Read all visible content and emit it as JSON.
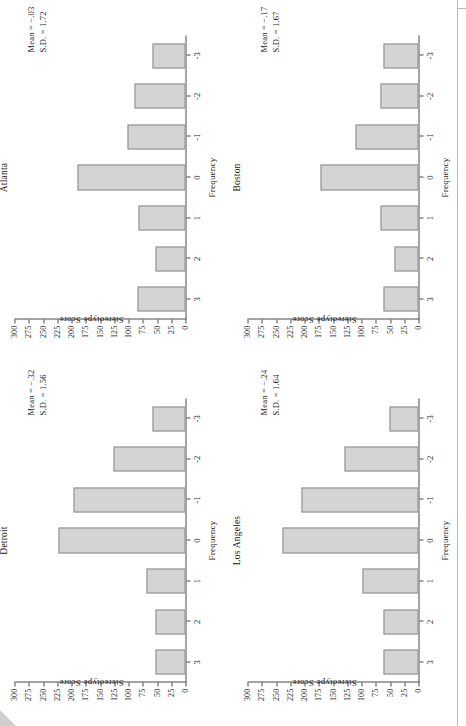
{
  "figure": {
    "orientation": "rotated-90-ccw",
    "panel_count": 4,
    "bar_fill": "#d4d4d4",
    "bar_stroke": "#8a8a8a"
  },
  "labels": {
    "frequency_axis_title": "Frequency",
    "score_axis_title": "Stereotype Score",
    "mean_prefix": "Mean = ",
    "sd_prefix": "S.D. = "
  },
  "chart_data": [
    {
      "type": "bar",
      "title": "Atlanta",
      "xlabel": "Stereotype Score",
      "ylabel": "Frequency",
      "categories": [
        "3",
        "2",
        "1",
        "0",
        "-1",
        "-2",
        "-3"
      ],
      "values": [
        85,
        52,
        82,
        190,
        101,
        90,
        58
      ],
      "ylim": [
        0,
        300
      ],
      "yticks": [
        0,
        25,
        50,
        75,
        100,
        125,
        150,
        175,
        200,
        225,
        250,
        275,
        300
      ],
      "ytick_labels": [
        "0",
        "25",
        "50",
        "75",
        "100",
        "125",
        "150",
        "175",
        "200",
        "225",
        "250",
        "275",
        "300"
      ],
      "grid": false,
      "legend": "none",
      "annotations": {
        "mean": "Mean = −.03",
        "sd": "S.D. = 1.72"
      }
    },
    {
      "type": "bar",
      "title": "Boston",
      "xlabel": "Stereotype Score",
      "ylabel": "Frequency",
      "categories": [
        "3",
        "2",
        "1",
        "0",
        "-1",
        "-2",
        "-3"
      ],
      "values": [
        62,
        42,
        67,
        172,
        110,
        67,
        61
      ],
      "ylim": [
        0,
        300
      ],
      "yticks": [
        0,
        25,
        50,
        75,
        100,
        125,
        150,
        175,
        200,
        225,
        250,
        275,
        300
      ],
      "ytick_labels": [
        "0",
        "25",
        "50",
        "75",
        "100",
        "125",
        "150",
        "175",
        "200",
        "225",
        "250",
        "275",
        "300"
      ],
      "grid": false,
      "legend": "none",
      "annotations": {
        "mean": "Mean = −.17",
        "sd": "S.D. = 1.67"
      }
    },
    {
      "type": "bar",
      "title": "Detroit",
      "xlabel": "Stereotype Score",
      "ylabel": "Frequency",
      "categories": [
        "3",
        "2",
        "1",
        "0",
        "-1",
        "-2",
        "-3"
      ],
      "values": [
        52,
        52,
        68,
        222,
        196,
        126,
        58
      ],
      "ylim": [
        0,
        300
      ],
      "yticks": [
        0,
        25,
        50,
        75,
        100,
        125,
        150,
        175,
        200,
        225,
        250,
        275,
        300
      ],
      "ytick_labels": [
        "0",
        "25",
        "50",
        "75",
        "100",
        "125",
        "150",
        "175",
        "200",
        "225",
        "250",
        "275",
        "300"
      ],
      "grid": false,
      "legend": "none",
      "annotations": {
        "mean": "Mean = −.32",
        "sd": "S.D. = 1.56"
      }
    },
    {
      "type": "bar",
      "title": "Los Angeles",
      "xlabel": "Stereotype Score",
      "ylabel": "Frequency",
      "categories": [
        "3",
        "2",
        "1",
        "0",
        "-1",
        "-2",
        "-3"
      ],
      "values": [
        61,
        61,
        98,
        238,
        205,
        130,
        51
      ],
      "ylim": [
        0,
        300
      ],
      "yticks": [
        0,
        25,
        50,
        75,
        100,
        125,
        150,
        175,
        200,
        225,
        250,
        275,
        300
      ],
      "ytick_labels": [
        "0",
        "25",
        "50",
        "75",
        "100",
        "125",
        "150",
        "175",
        "200",
        "225",
        "250",
        "275",
        "300"
      ],
      "grid": false,
      "legend": "none",
      "annotations": {
        "mean": "Mean = −.24",
        "sd": "S.D. = 1.64"
      }
    }
  ]
}
